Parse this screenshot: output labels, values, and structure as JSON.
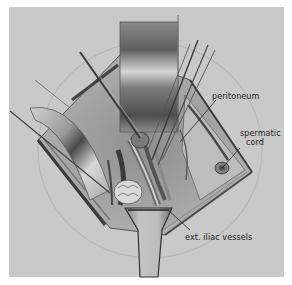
{
  "figure": {
    "type": "surgical anatomy illustration",
    "colors": {
      "page_background": "#ffffff",
      "panel_background": "#c9c9c9",
      "ink": "#222222",
      "retractor_dark": "#6a6a6a",
      "retractor_light": "#d8d8d8"
    },
    "labels": [
      {
        "id": "peritoneum",
        "text": "peritoneum"
      },
      {
        "id": "spermatic-cord",
        "text": "spermatic\ncord",
        "line1": "spermatic",
        "line2": "cord"
      },
      {
        "id": "ext-iliac-vessels",
        "text": "ext. iliac vessels"
      }
    ]
  }
}
